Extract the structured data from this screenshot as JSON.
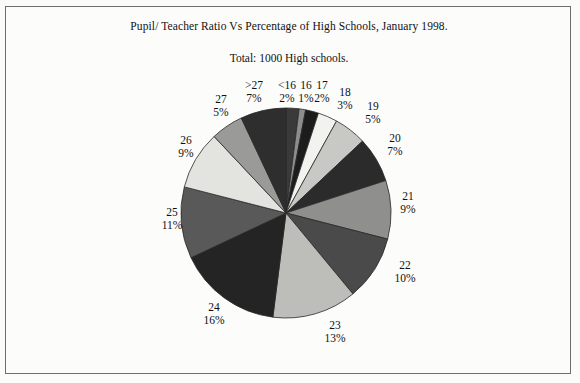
{
  "figure": {
    "title": "Pupil/ Teacher Ratio Vs Percentage of High Schools, January 1998.",
    "subtitle": "Total: 1000 High schools."
  },
  "chart_data": {
    "type": "pie",
    "title": "Pupil/ Teacher Ratio Vs Percentage of High Schools, January 1998.",
    "subtitle": "Total: 1000 High schools.",
    "xlabel": "",
    "ylabel": "",
    "legend": "none",
    "grid": false,
    "total_label": "Total: 1000 High schools.",
    "total": 1000,
    "units": "percent",
    "start_angle_deg": 0,
    "direction": "clockwise",
    "categories": [
      "<16",
      "16",
      "17",
      "18",
      "19",
      "20",
      "21",
      "22",
      "23",
      "24",
      "25",
      "26",
      "27",
      ">27"
    ],
    "values": [
      2,
      1,
      2,
      3,
      5,
      7,
      9,
      10,
      13,
      16,
      11,
      9,
      5,
      7
    ],
    "labels": [
      {
        "cat": "<16",
        "pct": "2%",
        "value": 2,
        "color": "#3a3a3a"
      },
      {
        "cat": "16",
        "pct": "1%",
        "value": 1,
        "color": "#8d8d8d"
      },
      {
        "cat": "17",
        "pct": "2%",
        "value": 2,
        "color": "#1c1c1c"
      },
      {
        "cat": "18",
        "pct": "3%",
        "value": 3,
        "color": "#f2f2ee"
      },
      {
        "cat": "19",
        "pct": "5%",
        "value": 5,
        "color": "#c8c8c4"
      },
      {
        "cat": "20",
        "pct": "7%",
        "value": 7,
        "color": "#2b2b2b"
      },
      {
        "cat": "21",
        "pct": "9%",
        "value": 9,
        "color": "#8f8f8d"
      },
      {
        "cat": "22",
        "pct": "10%",
        "value": 10,
        "color": "#4a4a4a"
      },
      {
        "cat": "23",
        "pct": "13%",
        "value": 13,
        "color": "#bdbdb9"
      },
      {
        "cat": "24",
        "pct": "16%",
        "value": 16,
        "color": "#242424"
      },
      {
        "cat": "25",
        "pct": "11%",
        "value": 11,
        "color": "#595959"
      },
      {
        "cat": "26",
        "pct": "9%",
        "value": 9,
        "color": "#e3e3df"
      },
      {
        "cat": "27",
        "pct": "5%",
        "value": 5,
        "color": "#9a9a98"
      },
      {
        "cat": ">27",
        "pct": "7%",
        "value": 7,
        "color": "#2e2e2e"
      }
    ]
  },
  "colors": {
    "page_background": "#fbfbfa",
    "frame_border": "#6d6d6d",
    "text": "#111111",
    "slice_outline": "#2a2a2a"
  }
}
